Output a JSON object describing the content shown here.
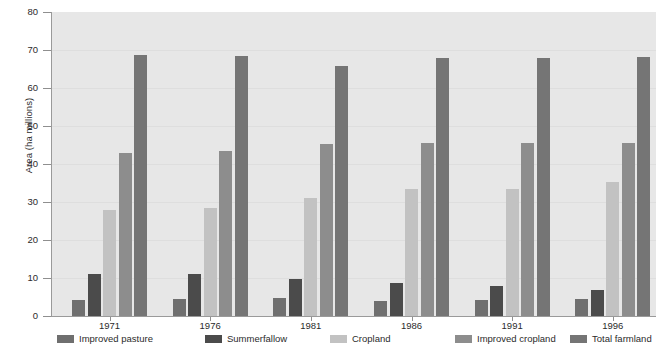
{
  "chart_data": {
    "type": "bar",
    "title": "",
    "subtitle": "",
    "xlabel": "",
    "ylabel": "Area (ha millions)",
    "categories": [
      "1971",
      "1976",
      "1981",
      "1986",
      "1991",
      "1996"
    ],
    "ylim": [
      0,
      80
    ],
    "yticks": [
      0,
      10,
      20,
      30,
      40,
      50,
      60,
      70,
      80
    ],
    "grid": true,
    "legend_position": "bottom",
    "series": [
      {
        "name": "Improved pasture",
        "color": "#6f6f6f",
        "values": [
          4.3,
          4.4,
          4.7,
          3.9,
          4.3,
          4.5
        ]
      },
      {
        "name": "Summerfallow",
        "color": "#4b4b4b",
        "values": [
          11.0,
          11.1,
          9.8,
          8.7,
          8.0,
          6.8
        ]
      },
      {
        "name": "Cropland",
        "color": "#c2c2c2",
        "values": [
          27.9,
          28.5,
          31.0,
          33.3,
          33.5,
          35.2
        ]
      },
      {
        "name": "Improved cropland",
        "color": "#8d8d8d",
        "values": [
          42.8,
          43.5,
          45.2,
          45.4,
          45.6,
          45.6
        ]
      },
      {
        "name": "Total farmland",
        "color": "#757575",
        "values": [
          68.7,
          68.4,
          65.9,
          68.0,
          67.9,
          68.1
        ]
      }
    ],
    "plot_background": "#e7e7e7",
    "gridline_color": "#dedede",
    "axis_color": "#9a9a9a",
    "text_color": "#2b2b2b"
  }
}
